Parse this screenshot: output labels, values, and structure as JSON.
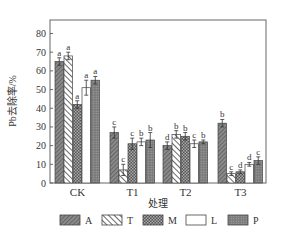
{
  "chart_data": {
    "type": "bar",
    "title": "",
    "xlabel": "处理",
    "ylabel": "Pb去除率/%",
    "ylim": [
      0,
      80
    ],
    "yticks": [
      0,
      10,
      20,
      30,
      40,
      50,
      60,
      70,
      80
    ],
    "grid": false,
    "legend_position": "bottom",
    "categories": [
      "CK",
      "T1",
      "T2",
      "T3"
    ],
    "series": [
      {
        "name": "A",
        "pattern": "diag-fine",
        "values": [
          65,
          27,
          20,
          32
        ],
        "errors": [
          2,
          3,
          2,
          2
        ],
        "letters": [
          "a",
          "c",
          "d",
          "b"
        ]
      },
      {
        "name": "T",
        "pattern": "diag-wide",
        "values": [
          68,
          7,
          26,
          5
        ],
        "errors": [
          2,
          3,
          2,
          1
        ],
        "letters": [
          "a",
          "c",
          "b",
          "c"
        ]
      },
      {
        "name": "M",
        "pattern": "checker",
        "values": [
          42,
          21,
          25,
          6
        ],
        "errors": [
          2,
          3,
          2,
          1
        ],
        "letters": [
          "a",
          "c",
          "b",
          "d"
        ]
      },
      {
        "name": "L",
        "pattern": "none",
        "values": [
          51,
          22,
          21,
          10
        ],
        "errors": [
          4,
          2,
          2,
          1
        ],
        "letters": [
          "a",
          "b",
          "c",
          "d"
        ]
      },
      {
        "name": "P",
        "pattern": "dots",
        "values": [
          55,
          23,
          22,
          12
        ],
        "errors": [
          2,
          4,
          1,
          2
        ],
        "letters": [
          "a",
          "b",
          "b",
          "c"
        ]
      }
    ]
  },
  "axis": {
    "y_label": "Pb去除率/%",
    "x_label": "处理",
    "y_ticks": [
      "0",
      "10",
      "20",
      "30",
      "40",
      "50",
      "60",
      "70",
      "80"
    ],
    "categories": [
      "CK",
      "T1",
      "T2",
      "T3"
    ]
  },
  "legend": {
    "items": [
      {
        "label": "A"
      },
      {
        "label": "T"
      },
      {
        "label": "M"
      },
      {
        "label": "L"
      },
      {
        "label": "P"
      }
    ]
  }
}
